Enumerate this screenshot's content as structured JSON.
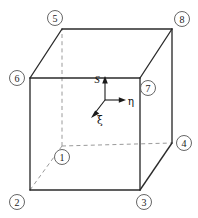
{
  "figure": {
    "background_color": "#ffffff",
    "solid_edge_color": "#2b2b2b",
    "hidden_edge_color": "#9a9a9a",
    "node_circle_stroke": "#555555",
    "axis_color": "#1a1a1a"
  },
  "nodes": [
    {
      "id": "node-1",
      "label": "1",
      "x": 62,
      "y": 146,
      "hidden": true
    },
    {
      "id": "node-2",
      "label": "2",
      "x": 30,
      "y": 190,
      "hidden": false
    },
    {
      "id": "node-3",
      "label": "3",
      "x": 140,
      "y": 190,
      "hidden": false
    },
    {
      "id": "node-4",
      "label": "4",
      "x": 172,
      "y": 143,
      "hidden": false
    },
    {
      "id": "node-5",
      "label": "5",
      "x": 62,
      "y": 29,
      "hidden": false
    },
    {
      "id": "node-6",
      "label": "6",
      "x": 30,
      "y": 78,
      "hidden": false
    },
    {
      "id": "node-7",
      "label": "7",
      "x": 140,
      "y": 78,
      "hidden": false
    },
    {
      "id": "node-8",
      "label": "8",
      "x": 172,
      "y": 29,
      "hidden": false
    }
  ],
  "node_labels": {
    "n1": "1",
    "n2": "2",
    "n3": "3",
    "n4": "4",
    "n5": "5",
    "n6": "6",
    "n7": "7",
    "n8": "8"
  },
  "axes": {
    "origin": {
      "x": 105,
      "y": 100
    },
    "vertical": {
      "name": "s-axis",
      "label": "S",
      "direction": "up",
      "label_x": 97,
      "label_y": 79
    },
    "horizontal": {
      "name": "eta-axis",
      "label": "η",
      "direction": "right",
      "label_x": 131,
      "label_y": 100
    },
    "diagonal": {
      "name": "xi-axis",
      "label": "ξ",
      "direction": "down-left",
      "label_x": 99,
      "label_y": 119
    }
  },
  "geometry": {
    "front_face": "30,78 140,78 140,190 30,190",
    "top_face": "30,78 62,29 172,29 140,78",
    "right_face": "140,78 172,29 172,143 140,190",
    "front_top_left": {
      "x": 30,
      "y": 78
    },
    "front_top_right": {
      "x": 140,
      "y": 78
    },
    "front_bottom_right": {
      "x": 140,
      "y": 190
    },
    "front_bottom_left": {
      "x": 30,
      "y": 190
    },
    "back_top_left": {
      "x": 62,
      "y": 29
    },
    "back_top_right": {
      "x": 172,
      "y": 29
    },
    "back_bottom_right": {
      "x": 172,
      "y": 143
    },
    "back_bottom_left": {
      "x": 62,
      "y": 146
    }
  }
}
